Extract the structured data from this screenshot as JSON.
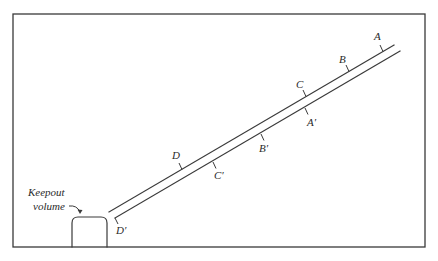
{
  "figure": {
    "frame": {
      "x": 13,
      "y": 14,
      "width": 412,
      "height": 233,
      "color": "#3a3a3a"
    },
    "keepout": {
      "label_line1": "Keepout",
      "label_line2": "volume",
      "box": {
        "x": 72,
        "y": 217,
        "width": 35,
        "height": 30,
        "radius": 6
      }
    },
    "rails": {
      "upper": {
        "x1": 109,
        "y1": 212,
        "x2": 394,
        "y2": 45
      },
      "lower": {
        "x1": 115,
        "y1": 218,
        "x2": 400,
        "y2": 51
      }
    },
    "markers_upper": [
      {
        "id": "A",
        "label": "A"
      },
      {
        "id": "B",
        "label": "B"
      },
      {
        "id": "C",
        "label": "C"
      },
      {
        "id": "D",
        "label": "D"
      }
    ],
    "markers_lower": [
      {
        "id": "A_prime",
        "label": "A′"
      },
      {
        "id": "B_prime",
        "label": "B′"
      },
      {
        "id": "C_prime",
        "label": "C′"
      },
      {
        "id": "D_prime",
        "label": "D′"
      }
    ]
  }
}
